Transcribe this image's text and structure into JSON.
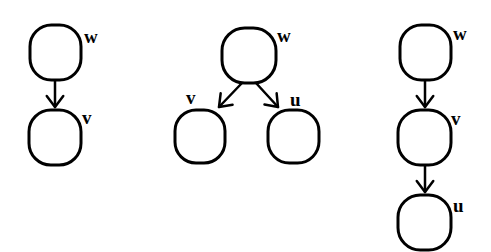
{
  "graphs": [
    {
      "id": "graph-1",
      "nodes": [
        {
          "id": "w",
          "label": "w",
          "x": 30,
          "y": 25,
          "w": 51,
          "h": 55,
          "lx": 84,
          "ly": 43
        },
        {
          "id": "v",
          "label": "v",
          "x": 29,
          "y": 110,
          "w": 52,
          "h": 55,
          "lx": 82,
          "ly": 124
        }
      ],
      "edges": [
        {
          "from": "w",
          "to": "v",
          "x1": 55,
          "y1": 80,
          "x2": 55,
          "y2": 107
        }
      ]
    },
    {
      "id": "graph-2",
      "nodes": [
        {
          "id": "w",
          "label": "w",
          "x": 222,
          "y": 28,
          "w": 54,
          "h": 55,
          "lx": 277,
          "ly": 42
        },
        {
          "id": "v",
          "label": "v",
          "x": 175,
          "y": 110,
          "w": 50,
          "h": 53,
          "lx": 186,
          "ly": 104
        },
        {
          "id": "u",
          "label": "u",
          "x": 268,
          "y": 110,
          "w": 51,
          "h": 53,
          "lx": 290,
          "ly": 106
        }
      ],
      "edges": [
        {
          "from": "w",
          "to": "v",
          "x1": 242,
          "y1": 83,
          "x2": 219,
          "y2": 107
        },
        {
          "from": "w",
          "to": "u",
          "x1": 256,
          "y1": 83,
          "x2": 278,
          "y2": 107
        }
      ]
    },
    {
      "id": "graph-3",
      "nodes": [
        {
          "id": "w",
          "label": "w",
          "x": 400,
          "y": 25,
          "w": 51,
          "h": 55,
          "lx": 453,
          "ly": 40
        },
        {
          "id": "v",
          "label": "v",
          "x": 398,
          "y": 110,
          "w": 53,
          "h": 55,
          "lx": 451,
          "ly": 125
        },
        {
          "id": "u",
          "label": "u",
          "x": 398,
          "y": 195,
          "w": 53,
          "h": 55,
          "lx": 453,
          "ly": 212
        }
      ],
      "edges": [
        {
          "from": "w",
          "to": "v",
          "x1": 425,
          "y1": 80,
          "x2": 425,
          "y2": 107
        },
        {
          "from": "v",
          "to": "u",
          "x1": 425,
          "y1": 165,
          "x2": 425,
          "y2": 192
        }
      ]
    }
  ],
  "colors": {
    "stroke": "#000000",
    "background": "#ffffff"
  }
}
